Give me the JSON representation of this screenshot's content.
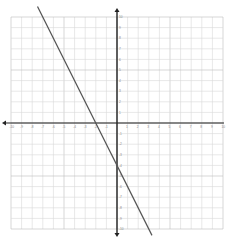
{
  "chart_data": {
    "type": "line",
    "title": "",
    "xlabel": "",
    "ylabel": "",
    "xlim": [
      -10,
      10
    ],
    "ylim": [
      -10,
      10
    ],
    "grid": true,
    "grid_step": 1,
    "x_ticks": [
      -10,
      -9,
      -8,
      -7,
      -6,
      -5,
      -4,
      -3,
      -2,
      -1,
      1,
      2,
      3,
      4,
      5,
      6,
      7,
      8,
      9,
      10
    ],
    "y_ticks": [
      -10,
      -9,
      -8,
      -7,
      -6,
      -5,
      -4,
      -3,
      -2,
      -1,
      1,
      2,
      3,
      4,
      5,
      6,
      7,
      8,
      9,
      10
    ],
    "series": [
      {
        "name": "line",
        "equation": "y = -2x - 4",
        "slope": -2,
        "intercept": -4,
        "x": [
          -7.5,
          3.3
        ],
        "y": [
          11,
          -10.6
        ],
        "color": "#555555"
      }
    ],
    "x_intercept": -2,
    "y_intercept": -4
  },
  "colors": {
    "grid_minor": "#d9d9d9",
    "grid_major": "#bdbdbd",
    "axis": "#222222",
    "line": "#555555"
  }
}
